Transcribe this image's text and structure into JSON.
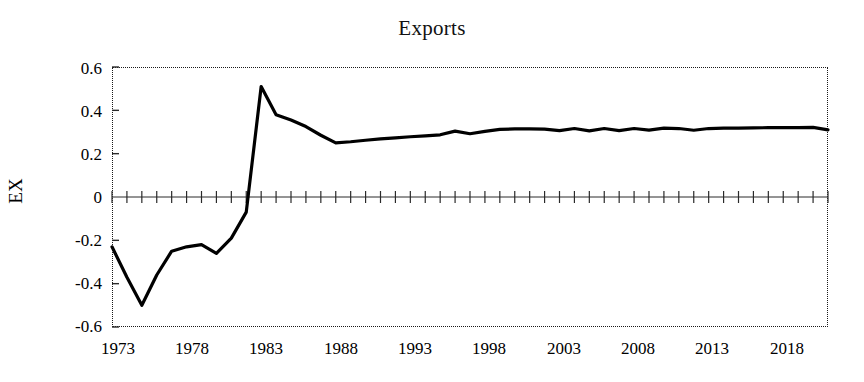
{
  "chart_data": {
    "type": "line",
    "title": "Exports",
    "xlabel": "",
    "ylabel": "EX",
    "xlim": [
      1973,
      2021
    ],
    "ylim": [
      -0.6,
      0.6
    ],
    "grid": false,
    "legend": null,
    "x_ticks": [
      "1973",
      "1978",
      "1983",
      "1988",
      "1993",
      "1998",
      "2003",
      "2008",
      "2013",
      "2018"
    ],
    "x_tick_values": [
      1973,
      1978,
      1983,
      1988,
      1993,
      1998,
      2003,
      2008,
      2013,
      2018
    ],
    "y_ticks": [
      "0.6",
      "0.4",
      "0.2",
      "0",
      "-0.2",
      "-0.4",
      "-0.6"
    ],
    "y_tick_values": [
      0.6,
      0.4,
      0.2,
      0,
      -0.2,
      -0.4,
      -0.6
    ],
    "minor_x_ticks_every": 1,
    "line_color": "#000000",
    "line_width": 3.2,
    "series": [
      {
        "name": "EX",
        "x": [
          1973,
          1974,
          1975,
          1976,
          1977,
          1978,
          1979,
          1980,
          1981,
          1982,
          1983,
          1984,
          1985,
          1986,
          1987,
          1988,
          1989,
          1990,
          1991,
          1992,
          1993,
          1994,
          1995,
          1996,
          1997,
          1998,
          1999,
          2000,
          2001,
          2002,
          2003,
          2004,
          2005,
          2006,
          2007,
          2008,
          2009,
          2010,
          2011,
          2012,
          2013,
          2014,
          2015,
          2016,
          2017,
          2018,
          2019,
          2020,
          2021
        ],
        "values": [
          -0.23,
          -0.37,
          -0.5,
          -0.36,
          -0.25,
          -0.23,
          -0.22,
          -0.26,
          -0.19,
          -0.07,
          0.51,
          0.38,
          0.355,
          0.325,
          0.285,
          0.25,
          0.255,
          0.262,
          0.268,
          0.273,
          0.278,
          0.282,
          0.287,
          0.304,
          0.292,
          0.303,
          0.312,
          0.314,
          0.314,
          0.313,
          0.306,
          0.316,
          0.305,
          0.316,
          0.306,
          0.316,
          0.309,
          0.318,
          0.316,
          0.308,
          0.316,
          0.318,
          0.318,
          0.319,
          0.32,
          0.32,
          0.32,
          0.321,
          0.31
        ]
      }
    ]
  }
}
